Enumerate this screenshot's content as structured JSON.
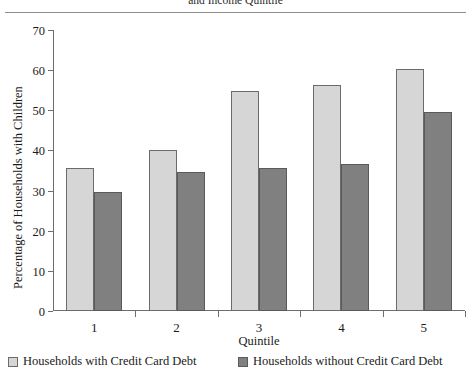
{
  "chart_data": {
    "type": "bar",
    "title": "and Income Quintile",
    "title_note": "title is cropped at the top edge of the screenshot; only the lower portion of the line \"and Income Quintile\" is visible",
    "xlabel": "Quintile",
    "ylabel": "Percentage of Households with Children",
    "categories": [
      "1",
      "2",
      "3",
      "4",
      "5"
    ],
    "series": [
      {
        "name": "Households with Credit Card Debt",
        "color": "#d6d6d6",
        "values": [
          35.6,
          40.2,
          54.9,
          56.4,
          60.3
        ]
      },
      {
        "name": "Households without Credit Card Debt",
        "color": "#808080",
        "values": [
          29.7,
          34.7,
          35.7,
          36.5,
          49.5
        ]
      }
    ],
    "ylim": [
      0,
      70
    ],
    "yticks": [
      0,
      10,
      20,
      30,
      40,
      50,
      60,
      70
    ],
    "ytick_labels": [
      "0",
      "10",
      "20",
      "30",
      "40",
      "50",
      "60",
      "70"
    ],
    "grid": false,
    "legend_position": "bottom"
  },
  "legend": [
    {
      "label": "Households with Credit Card Debt",
      "swatch": "light-gray-swatch"
    },
    {
      "label": "Households without Credit Card Debt",
      "swatch": "dark-gray-swatch"
    }
  ]
}
